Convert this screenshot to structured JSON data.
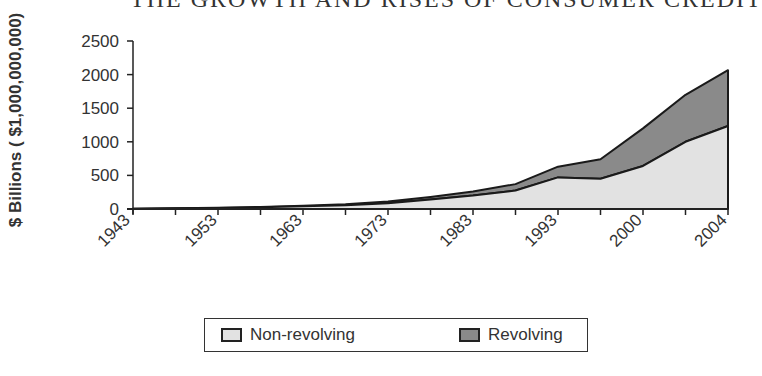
{
  "title": "THE GROWTH AND RISES OF CONSUMER CREDIT",
  "chart_data": {
    "type": "area",
    "stacked": true,
    "title": "THE GROWTH AND RISES OF CONSUMER CREDIT",
    "xlabel": "",
    "ylabel": "$ Billions ( $1,000,000,000)",
    "ylim": [
      0,
      2500
    ],
    "yticks": [
      0,
      500,
      1000,
      1500,
      2000,
      2500
    ],
    "x_tick_labels": [
      "1943",
      "1953",
      "1963",
      "1973",
      "1983",
      "1993",
      "2000",
      "2004"
    ],
    "legend_position": "bottom",
    "grid": false,
    "series": [
      {
        "name": "Non-revolving",
        "color": "#e2e2e2",
        "values": [
          5,
          10,
          15,
          25,
          40,
          55,
          85,
          140,
          200,
          275,
          470,
          450,
          640,
          1000,
          1235
        ]
      },
      {
        "name": "Revolving",
        "color": "#8a8a8a",
        "values": [
          0,
          2,
          3,
          5,
          10,
          15,
          25,
          40,
          60,
          95,
          160,
          290,
          560,
          700,
          830
        ]
      }
    ]
  },
  "legend": {
    "items": [
      {
        "label": "Non-revolving",
        "color": "#e2e2e2"
      },
      {
        "label": "Revolving",
        "color": "#8a8a8a"
      }
    ]
  }
}
